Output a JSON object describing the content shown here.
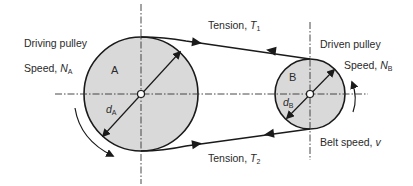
{
  "diagram": {
    "type": "belt-drive",
    "colors": {
      "pulley_fill": "#d9d9d9",
      "line": "#1a1a1a",
      "text": "#2a2a2a",
      "background": "#ffffff"
    },
    "pulley_a": {
      "letter": "A",
      "title": "Driving pulley",
      "speed_prefix": "Speed, ",
      "speed_symbol": "N",
      "speed_subscript": "A",
      "diameter_symbol": "d",
      "diameter_subscript": "A"
    },
    "pulley_b": {
      "letter": "B",
      "title": "Driven pulley",
      "speed_prefix": "Speed, ",
      "speed_symbol": "N",
      "speed_subscript": "B",
      "diameter_symbol": "d",
      "diameter_subscript": "B"
    },
    "tension_top": {
      "prefix": "Tension, ",
      "symbol": "T",
      "subscript": "1"
    },
    "tension_bottom": {
      "prefix": "Tension, ",
      "symbol": "T",
      "subscript": "2"
    },
    "belt_speed": {
      "prefix": "Belt speed, ",
      "symbol": "v"
    }
  }
}
